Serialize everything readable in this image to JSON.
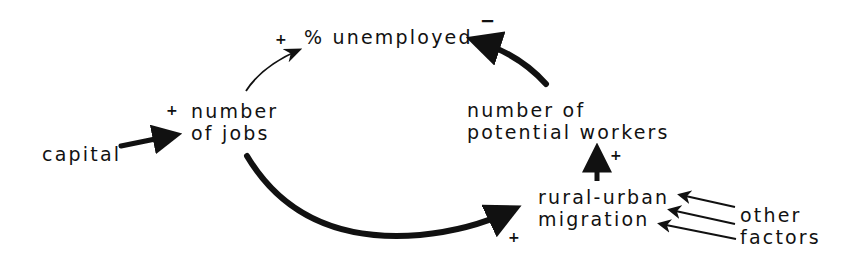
{
  "diagram": {
    "type": "causal-loop",
    "nodes": {
      "unemployed": {
        "label": "% unemployed"
      },
      "jobs": {
        "line1": "number",
        "line2": "of jobs"
      },
      "capital": {
        "label": "capital"
      },
      "workers": {
        "line1": "number of",
        "line2": "potential workers"
      },
      "migration": {
        "line1": "rural-urban",
        "line2": "migration"
      },
      "other": {
        "line1": "other",
        "line2": "factors"
      }
    },
    "edges": [
      {
        "from": "capital",
        "to": "jobs",
        "polarity": "+"
      },
      {
        "from": "jobs",
        "to": "unemployed",
        "polarity": "+"
      },
      {
        "from": "jobs",
        "to": "migration",
        "polarity": "+"
      },
      {
        "from": "migration",
        "to": "workers",
        "polarity": "+"
      },
      {
        "from": "workers",
        "to": "unemployed",
        "polarity": "−"
      },
      {
        "from": "other",
        "to": "migration",
        "polarity": ""
      }
    ],
    "signs": {
      "jobs_in": "+",
      "unemployed_in": "+",
      "unemployed_neg": "−",
      "workers_in": "+",
      "migration_in": "+"
    },
    "colors": {
      "ink": "#111111",
      "background": "#ffffff"
    }
  }
}
